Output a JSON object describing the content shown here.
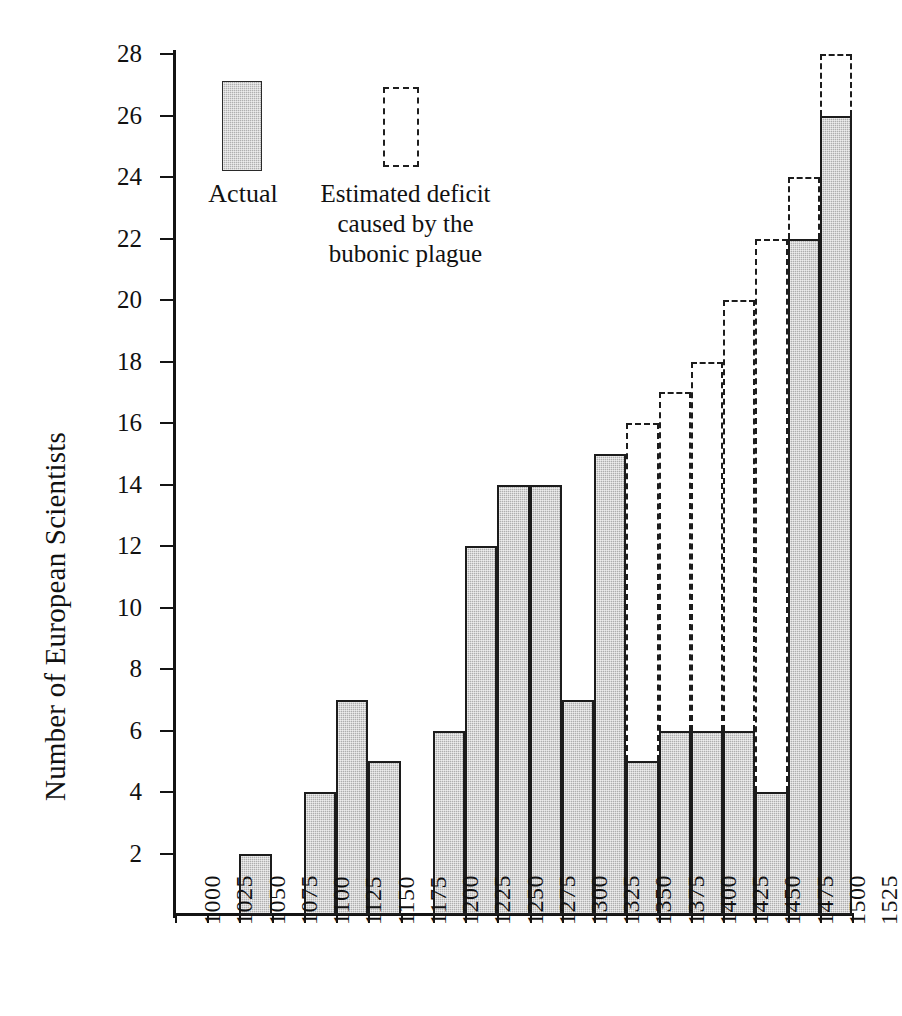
{
  "chart_data": {
    "type": "bar",
    "title": "",
    "xlabel": "",
    "ylabel": "Number of European Scientists",
    "ylim": [
      0,
      28
    ],
    "ytick_step": 2,
    "yticks": [
      0,
      2,
      4,
      6,
      8,
      10,
      12,
      14,
      16,
      18,
      20,
      22,
      24,
      26,
      28
    ],
    "ytick_labels": [
      "",
      "2",
      "4",
      "6",
      "8",
      "10",
      "12",
      "14",
      "16",
      "18",
      "20",
      "22",
      "24",
      "26",
      "28"
    ],
    "grid": false,
    "bin_width_years": 25,
    "x_tick_labels": [
      "1000",
      "1025",
      "1050",
      "1075",
      "1100",
      "1125",
      "1150",
      "1175",
      "1200",
      "1225",
      "1250",
      "1275",
      "1300",
      "1325",
      "1350",
      "1375",
      "1400",
      "1425",
      "1450",
      "1475",
      "1500",
      "1525"
    ],
    "categories": [
      "1000",
      "1025",
      "1050",
      "1075",
      "1100",
      "1125",
      "1150",
      "1175",
      "1200",
      "1225",
      "1250",
      "1275",
      "1300",
      "1325",
      "1350",
      "1375",
      "1400",
      "1425",
      "1450",
      "1475",
      "1500"
    ],
    "series": [
      {
        "name": "Actual",
        "style": "filled-hatched",
        "values": [
          0,
          0,
          2,
          0,
          4,
          7,
          5,
          0,
          6,
          12,
          14,
          14,
          7,
          15,
          5,
          6,
          6,
          6,
          4,
          22,
          26
        ]
      },
      {
        "name": "Estimated deficit caused by the bubonic plague",
        "style": "dashed-outline",
        "note": "dashed outline drawn from top of actual bar up to estimated total",
        "estimated_totals": [
          null,
          null,
          null,
          null,
          null,
          null,
          null,
          null,
          null,
          null,
          null,
          null,
          null,
          null,
          16,
          17,
          18,
          20,
          22,
          24,
          28
        ]
      }
    ],
    "colors": {
      "bar_fill": "#aeaeae",
      "bar_stroke": "#1c1c1c",
      "axis": "#141414",
      "text": "#111111",
      "background": "#ffffff"
    }
  },
  "axes": {
    "y_title": "Number of European Scientists"
  },
  "legend": {
    "position": "top-left-inside",
    "actual_label": "Actual",
    "estimated_label_line1": "Estimated deficit",
    "estimated_label_line2": "caused by the",
    "estimated_label_line3": "bubonic plague"
  }
}
